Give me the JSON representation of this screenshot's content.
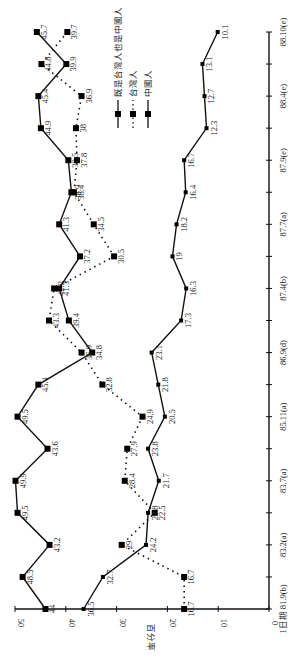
{
  "chart_data": {
    "type": "line",
    "orientation": "rotated-90-ccw",
    "title": "",
    "xlabel": "",
    "ylabel": "百分率",
    "ylim": [
      0,
      50
    ],
    "yticks": [
      0,
      10,
      20,
      30,
      40,
      50
    ],
    "x_tick_labels": [
      "1日期 81.9(b)",
      "83.2(a)",
      "83.7(a)",
      "85.11(a)",
      "86.9(d)",
      "87.4(b)",
      "87.7(a)",
      "87.9(e)",
      "88.4(e)",
      "88.10(e)"
    ],
    "x_tick_indices": [
      0,
      2,
      4,
      6,
      8,
      10,
      12,
      14,
      16,
      18
    ],
    "n_points": 19,
    "grid": false,
    "legend_position": "upper-right (rotated)",
    "series": [
      {
        "name": "既是台灣人也是中國人",
        "style": "solid",
        "marker": "square-large",
        "values": [
          44,
          48.5,
          43.2,
          49.5,
          49.9,
          43.6,
          49.5,
          45.4,
          34.8,
          39.4,
          41.3,
          37.2,
          41.3,
          38.9,
          39.5,
          44.9,
          45.4,
          39.9,
          45.7
        ]
      },
      {
        "name": "台灣人",
        "style": "dotted",
        "marker": "square-large",
        "values": [
          16.7,
          16.7,
          29,
          22.5,
          28.4,
          27.9,
          24.9,
          32.8,
          36.9,
          43.3,
          42.3,
          30.5,
          34.5,
          38.4,
          37.8,
          38,
          36.9,
          44.8,
          39.7
        ]
      },
      {
        "name": "中國人",
        "style": "solid",
        "marker": "square-small",
        "values": [
          36.5,
          32.7,
          24.2,
          23.8,
          21.7,
          23.8,
          20.5,
          21.8,
          23.1,
          17.3,
          16.3,
          19,
          18.2,
          16.4,
          16.7,
          12.3,
          12.7,
          13.1,
          10.1
        ]
      }
    ]
  },
  "legend": {
    "items": [
      {
        "label": "既是台灣人也是中國人",
        "style": "solid"
      },
      {
        "label": "台灣人",
        "style": "dotted"
      },
      {
        "label": "中國人",
        "style": "solid"
      }
    ]
  },
  "axis": {
    "ylabel": "百分率"
  }
}
